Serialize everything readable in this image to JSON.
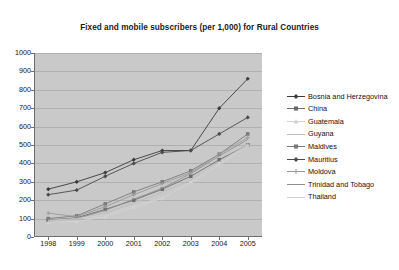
{
  "chart": {
    "title": "Fixed and mobile subscribers (per 1,000) for Rural Countries",
    "background": "#c9c9c9",
    "page_background": "#ffffff"
  },
  "axes": {
    "y_ticks": [
      "1000",
      "900",
      "800",
      "700",
      "600",
      "500",
      "400",
      "300",
      "200",
      "100",
      "0"
    ],
    "x_ticks": [
      "1998",
      "1999",
      "2000",
      "2001",
      "2002",
      "2003",
      "2004",
      "2005"
    ],
    "ylim": [
      0,
      1000
    ],
    "grid": true
  },
  "legend": {
    "position": "right",
    "items": [
      {
        "label": "Bosnia and Herzegovina",
        "color": "#3b3b3b",
        "marker": "diamond"
      },
      {
        "label": "China",
        "color": "#6b6b6b",
        "marker": "square"
      },
      {
        "label": "Guatemala",
        "color": "#d2d2d2",
        "marker": "triangle"
      },
      {
        "label": "Guyana",
        "color": "#bdbdbd",
        "marker": "none"
      },
      {
        "label": "Maldives",
        "color": "#7a7a7a",
        "marker": "square"
      },
      {
        "label": "Mauritius",
        "color": "#4a4a4a",
        "marker": "diamond"
      },
      {
        "label": "Moldova",
        "color": "#9a9a9a",
        "marker": "cross"
      },
      {
        "label": "Trinidad and Tobago",
        "color": "#8e8e8e",
        "marker": "none"
      },
      {
        "label": "Thailand",
        "color": "#cfcfcf",
        "marker": "none"
      }
    ]
  },
  "chart_data": {
    "type": "line",
    "title": "Fixed and mobile subscribers (per 1,000) for Rural Countries",
    "xlabel": "",
    "ylabel": "",
    "categories": [
      "1998",
      "1999",
      "2000",
      "2001",
      "2002",
      "2003",
      "2004",
      "2005"
    ],
    "ylim": [
      0,
      1000
    ],
    "yticks": [
      0,
      100,
      200,
      300,
      400,
      500,
      600,
      700,
      800,
      900,
      1000
    ],
    "grid": true,
    "legend_position": "right",
    "series": [
      {
        "name": "Bosnia and Herzegovina",
        "color": "#3b3b3b",
        "marker": "diamond",
        "values": [
          260,
          300,
          350,
          420,
          470,
          470,
          700,
          860
        ]
      },
      {
        "name": "China",
        "color": "#6b6b6b",
        "marker": "square",
        "values": [
          90,
          105,
          150,
          200,
          260,
          330,
          420,
          500
        ]
      },
      {
        "name": "Guatemala",
        "color": "#d2d2d2",
        "marker": "triangle",
        "values": [
          80,
          85,
          110,
          160,
          210,
          300,
          400,
          500
        ]
      },
      {
        "name": "Guyana",
        "color": "#bdbdbd",
        "marker": "none",
        "values": [
          85,
          95,
          130,
          185,
          245,
          310,
          410,
          505
        ]
      },
      {
        "name": "Maldives",
        "color": "#7a7a7a",
        "marker": "square",
        "values": [
          100,
          115,
          180,
          245,
          300,
          360,
          450,
          560
        ]
      },
      {
        "name": "Mauritius",
        "color": "#4a4a4a",
        "marker": "diamond",
        "values": [
          230,
          255,
          330,
          400,
          460,
          470,
          560,
          650
        ]
      },
      {
        "name": "Moldova",
        "color": "#9a9a9a",
        "marker": "cross",
        "values": [
          130,
          110,
          165,
          230,
          290,
          350,
          450,
          540
        ]
      },
      {
        "name": "Trinidad and Tobago",
        "color": "#8e8e8e",
        "marker": "none",
        "values": [
          95,
          100,
          145,
          205,
          265,
          345,
          440,
          530
        ]
      },
      {
        "name": "Thailand",
        "color": "#cfcfcf",
        "marker": "none",
        "values": [
          90,
          100,
          120,
          170,
          215,
          290,
          390,
          495
        ]
      }
    ]
  }
}
